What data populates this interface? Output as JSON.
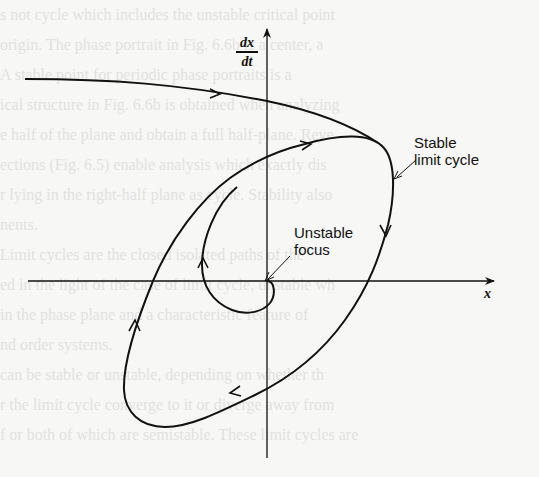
{
  "figure": {
    "type": "phase-plane-diagram",
    "axes": {
      "x_label": "x",
      "y_label_numerator": "dx",
      "y_label_denominator": "dt"
    },
    "annotations": {
      "stable_limit_cycle_line1": "Stable",
      "stable_limit_cycle_line2": "limit cycle",
      "unstable_focus_line1": "Unstable",
      "unstable_focus_line2": "focus"
    },
    "elements": [
      {
        "name": "outer-trajectory",
        "description": "Trajectory from far left converging onto the limit cycle"
      },
      {
        "name": "stable-limit-cycle",
        "description": "Closed orbit, clockwise direction"
      },
      {
        "name": "inner-spiral",
        "description": "Trajectory spiraling outward from unstable focus at origin toward limit cycle"
      }
    ],
    "colors": {
      "ink": "#111111",
      "paper": "#f7f7f5"
    }
  },
  "background_text": [
    "s not cycle which includes the unstable critical point",
    "origin. The phase portrait in Fig. 6.6b is a center, a",
    "  A stable point for periodic phase portraits is a",
    "ical structure in Fig. 6.6b is obtained when analyzing",
    "e half of the plane and obtain a full half-plane. Reve",
    "ections (Fig. 6.5) enable analysis which exactly dis",
    "r lying in the right-half plane as cycle. Stability also",
    "nents.",
    "",
    "  Limit cycles are the closed isolated paths of the",
    "ed in the light of the case of limit cycle, unstable wh",
    "in the phase plane and a characteristic feature of",
    "nd order systems.",
    "can be stable or unstable, depending on whether th",
    "r the limit cycle converge to it or diverge away from",
    "f or both of which are semistable. These limit cycles are",
    "   Figure 6.6 illustrates a stable limit cycle with"
  ]
}
